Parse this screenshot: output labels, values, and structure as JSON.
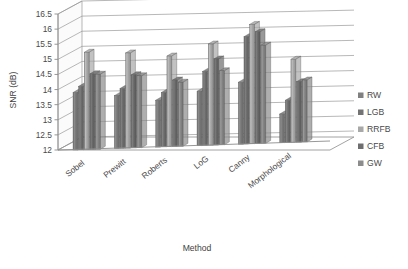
{
  "chart_data": {
    "type": "bar",
    "title": "",
    "subtitle": "",
    "xlabel": "Method",
    "ylabel": "SNR (dB)",
    "ylim": [
      12,
      16.5
    ],
    "ytick_step": 0.5,
    "yticks": [
      "16.5",
      "16",
      "15.5",
      "15",
      "14.5",
      "14",
      "13.5",
      "13",
      "12.5",
      "12"
    ],
    "ytick_values": [
      16.5,
      16,
      15.5,
      15,
      14.5,
      14,
      13.5,
      13,
      12.5,
      12
    ],
    "categories": [
      "Sobel",
      "Prewitt",
      "Roberts",
      "LoG",
      "Canny",
      "Morphological"
    ],
    "grid": true,
    "grid_axis": "y",
    "legend_position": "right",
    "projection": "3d-perspective",
    "series": [
      {
        "name": "RW",
        "color": "#808080",
        "values": [
          13.9,
          13.75,
          13.55,
          13.8,
          14.05,
          12.95
        ]
      },
      {
        "name": "LGB",
        "color": "#737373",
        "values": [
          14.1,
          13.98,
          13.8,
          14.45,
          15.55,
          13.4
        ]
      },
      {
        "name": "RRFB",
        "color": "#a8a8a8",
        "values": [
          15.22,
          15.15,
          15.0,
          15.35,
          15.95,
          14.75
        ]
      },
      {
        "name": "CFB",
        "color": "#6e6e6e",
        "values": [
          14.5,
          14.42,
          14.2,
          14.85,
          15.7,
          14.0
        ]
      },
      {
        "name": "GW",
        "color": "#8c8c8c",
        "values": [
          14.48,
          14.38,
          14.12,
          14.45,
          15.25,
          14.05
        ]
      }
    ]
  },
  "legend": {
    "items": [
      {
        "label": "RW",
        "swatch": "#808080"
      },
      {
        "label": "LGB",
        "swatch": "#737373"
      },
      {
        "label": "RRFB",
        "swatch": "#a8a8a8"
      },
      {
        "label": "CFB",
        "swatch": "#6e6e6e"
      },
      {
        "label": "GW",
        "swatch": "#8c8c8c"
      }
    ]
  },
  "axes": {
    "y_title": "SNR (dB)",
    "x_title": "Method"
  }
}
